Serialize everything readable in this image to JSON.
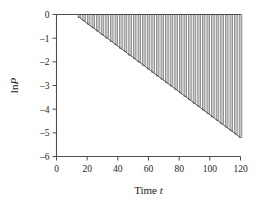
{
  "chart_data": {
    "type": "bar",
    "title": "",
    "subtitle": "",
    "xlabel": "Time",
    "xlabel_italic": "t",
    "ylabel": "ln",
    "ylabel_italic": "P",
    "xlim": [
      0,
      120
    ],
    "ylim": [
      -6,
      0
    ],
    "xticks": [
      0,
      20,
      40,
      60,
      80,
      100,
      120
    ],
    "xtick_labels": [
      "0",
      "20",
      "40",
      "60",
      "80",
      "100",
      "120"
    ],
    "yticks": [
      0,
      -1,
      -2,
      -3,
      -4,
      -5,
      -6
    ],
    "ytick_labels": [
      "0",
      "–1",
      "–2",
      "–3",
      "–4",
      "–5",
      "–6"
    ],
    "grid": false,
    "legend": null,
    "legend_position": "none",
    "bar_color": "#c9c9c9",
    "bar_edge_color": "#7d7d7d",
    "line_color": "#4d4d4d",
    "axis_color": "#4d4d4d",
    "bar_width": 2.6,
    "baseline": 0,
    "annotations": [],
    "fit_line": {
      "x": [
        14,
        120
      ],
      "y": [
        -0.08,
        -5.2
      ],
      "slope": -0.0483,
      "intercept": 0.596
    },
    "categories": [
      15,
      18,
      21,
      24,
      27,
      30,
      33,
      36,
      39,
      42,
      45,
      48,
      51,
      54,
      57,
      60,
      63,
      66,
      69,
      72,
      75,
      78,
      81,
      84,
      87,
      90,
      93,
      96,
      99,
      102,
      105,
      108,
      111,
      114,
      117,
      120
    ],
    "values": [
      -0.12,
      -0.27,
      -0.41,
      -0.56,
      -0.7,
      -0.85,
      -0.99,
      -1.14,
      -1.28,
      -1.43,
      -1.57,
      -1.72,
      -1.86,
      -2.01,
      -2.15,
      -2.3,
      -2.44,
      -2.59,
      -2.73,
      -2.88,
      -3.02,
      -3.17,
      -3.31,
      -3.46,
      -3.6,
      -3.75,
      -3.89,
      -4.04,
      -4.18,
      -4.33,
      -4.47,
      -4.62,
      -4.76,
      -4.91,
      -5.05,
      -5.2
    ]
  }
}
